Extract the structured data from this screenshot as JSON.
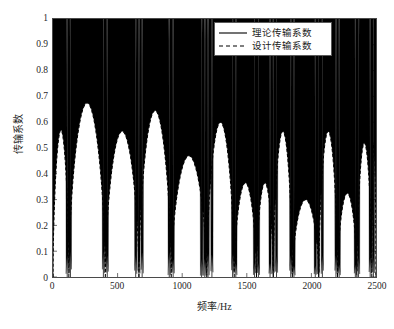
{
  "chart_data": {
    "type": "line",
    "title": "",
    "xlabel": "频率/Hz",
    "ylabel": "传输系数",
    "xlim": [
      0,
      2500
    ],
    "ylim": [
      0,
      1
    ],
    "grid": false,
    "legend_position": "top-right",
    "xticks": [
      0,
      500,
      1000,
      1500,
      2000,
      2500
    ],
    "xtick_labels": [
      "0",
      "500",
      "1000",
      "1500",
      "2000",
      "2500"
    ],
    "yticks": [
      0,
      0.1,
      0.2,
      0.3,
      0.4,
      0.5,
      0.6,
      0.7,
      0.8,
      0.9,
      1
    ],
    "ytick_labels": [
      "0",
      "0.1",
      "0.2",
      "0.3",
      "0.4",
      "0.5",
      "0.6",
      "0.7",
      "0.8",
      "0.9",
      "1"
    ],
    "series": [
      {
        "name": "理论传输系数",
        "style": "solid",
        "color": "#000000",
        "description": "Rapidly oscillating transmission coefficient with envelope reaching 1 between deep narrow nulls at resonance frequencies.",
        "null_frequencies": [
          110,
          135,
          390,
          420,
          640,
          665,
          690,
          900,
          930,
          1150,
          1175,
          1200,
          1230,
          1390,
          1415,
          1560,
          1590,
          1680,
          1705,
          1730,
          1840,
          1865,
          2030,
          2055,
          2085,
          2190,
          2215,
          2340,
          2365,
          2455,
          2480
        ],
        "envelope_max": 1.0
      },
      {
        "name": "设计传输系数",
        "style": "dashed",
        "color": "#000000",
        "description": "Smooth dashed envelope forming arches between the nulls, with peak heights decaying with frequency.",
        "arch_peaks": [
          {
            "f": 0,
            "value": 0.57
          },
          {
            "f": 260,
            "value": 0.675
          },
          {
            "f": 530,
            "value": 0.565
          },
          {
            "f": 790,
            "value": 0.645
          },
          {
            "f": 1050,
            "value": 0.47
          },
          {
            "f": 1310,
            "value": 0.6
          },
          {
            "f": 1500,
            "value": 0.365
          },
          {
            "f": 1780,
            "value": 0.565
          },
          {
            "f": 1950,
            "value": 0.3
          },
          {
            "f": 2130,
            "value": 0.565
          },
          {
            "f": 2280,
            "value": 0.325
          },
          {
            "f": 2420,
            "value": 0.52
          }
        ]
      }
    ]
  },
  "legend": {
    "items": [
      {
        "label": "理论传输系数",
        "style": "solid"
      },
      {
        "label": "设计传输系数",
        "style": "dashed"
      }
    ]
  }
}
